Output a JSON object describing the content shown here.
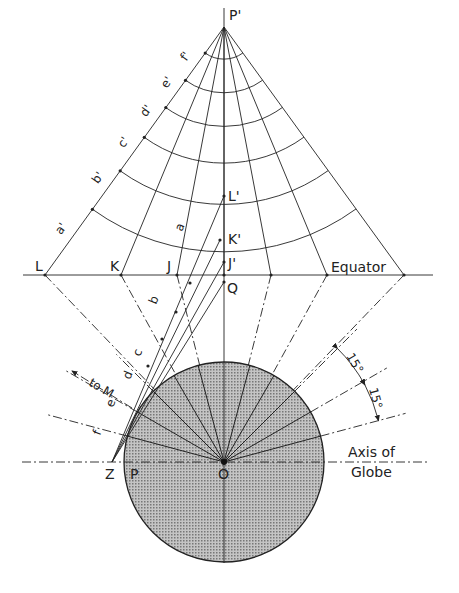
{
  "diagram": {
    "title": "",
    "points": {
      "P_prime": "P'",
      "L_prime": "L'",
      "K_prime": "K'",
      "J_prime": "J'",
      "Q": "Q",
      "L": "L",
      "K": "K",
      "J": "J",
      "O": "O",
      "P": "P",
      "Z": "Z"
    },
    "arc_labels_on_cone": [
      "a'",
      "b'",
      "c'",
      "d'",
      "e'",
      "f'"
    ],
    "ray_labels": [
      "a",
      "b",
      "c",
      "d",
      "e",
      "f"
    ],
    "equator_label": "Equator",
    "axis_label_line1": "Axis of",
    "axis_label_line2": "Globe",
    "arrow_label": "to M",
    "angle_labels": [
      "15°",
      "15°"
    ],
    "angle_step_degrees": 15,
    "colors": {
      "ink": "#222222",
      "globe_fill": "#a8a8a8",
      "background": "#ffffff"
    }
  }
}
